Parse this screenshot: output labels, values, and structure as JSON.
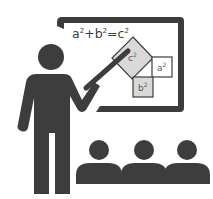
{
  "illustration": {
    "subject": "teacher presenting to students",
    "board": {
      "formula": {
        "a": "a",
        "b": "b",
        "c": "c",
        "exp": "2",
        "plus": "+",
        "eq": "="
      },
      "squares": [
        {
          "label": "c",
          "exp": "2"
        },
        {
          "label": "a",
          "exp": "2"
        },
        {
          "label": "b",
          "exp": "2"
        }
      ]
    },
    "students_count": 3
  },
  "colors": {
    "figure": "#3d3d3d",
    "square_fill": "#d9d9d9",
    "background": "#ffffff"
  }
}
